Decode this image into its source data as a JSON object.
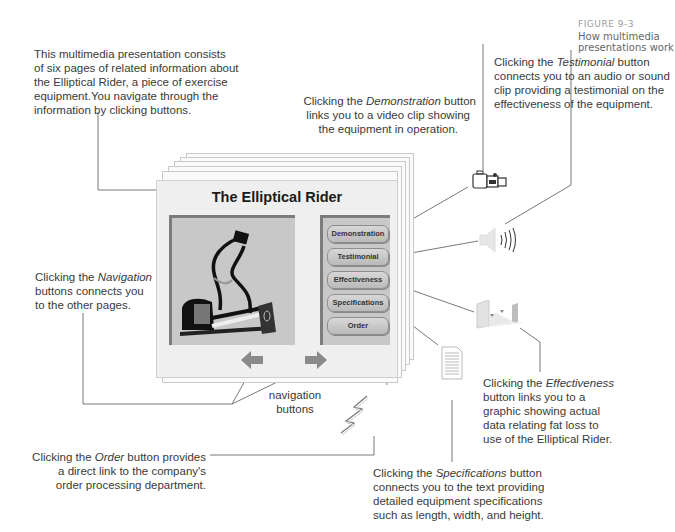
{
  "figure": {
    "label": "FIGURE 9-3",
    "title": "How multimedia presentations work"
  },
  "presentation": {
    "title": "The Elliptical Rider",
    "buttons": [
      {
        "label": "Demonstration"
      },
      {
        "label": "Testimonial"
      },
      {
        "label": "Effectiveness"
      },
      {
        "label": "Specifications"
      },
      {
        "label": "Order"
      }
    ],
    "nav_label_line1": "navigation",
    "nav_label_line2": "buttons",
    "page_count": 6
  },
  "callouts": {
    "intro": {
      "lines": [
        "This multimedia presentation consists",
        "of six pages of related information about",
        "the Elliptical Rider, a piece of exercise",
        "equipment.You navigate through the",
        "information by clicking buttons."
      ]
    },
    "demonstration": {
      "pre": "Clicking the ",
      "em": "Demonstration",
      "post": " button",
      "lines": [
        "links you to a video clip showing",
        "the equipment in operation."
      ],
      "icon": "video-camera-icon"
    },
    "testimonial": {
      "pre": "Clicking the ",
      "em": "Testimonial",
      "post": " button",
      "lines": [
        "connects you to an audio or sound",
        "clip providing a testimonial on the",
        "effectiveness of the equipment."
      ],
      "icon": "speaker-icon"
    },
    "navigation": {
      "pre": "Clicking the ",
      "em": "Navigation",
      "post": "",
      "lines": [
        "buttons connects you",
        "to the other pages."
      ]
    },
    "effectiveness": {
      "pre": "Clicking the ",
      "em": "Effectiveness",
      "post": "",
      "lines": [
        "button links you to a",
        "graphic showing actual",
        "data relating fat loss to",
        "use of the Elliptical Rider."
      ],
      "icon": "chart-graphic-icon"
    },
    "order": {
      "pre": "Clicking the ",
      "em": "Order",
      "post": " button provides",
      "lines": [
        "a direct link to the company's",
        "order processing department."
      ],
      "icon": "lightning-link-icon"
    },
    "specifications": {
      "pre": "Clicking the ",
      "em": "Specifications",
      "post": " button",
      "lines": [
        "connects you to the text providing",
        "detailed equipment specifications",
        "such as length, width, and height."
      ],
      "icon": "document-icon"
    }
  }
}
